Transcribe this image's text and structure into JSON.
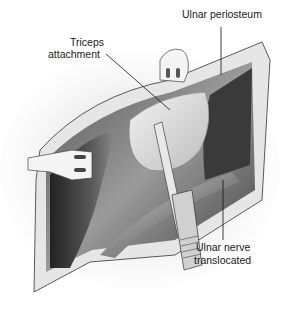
{
  "figure": {
    "type": "surgical-illustration",
    "labels": {
      "ulnar_periosteum": "Ulnar periosteum",
      "triceps_line1": "Triceps",
      "triceps_line2": "attachment",
      "nerve_line1": "Ulnar nerve",
      "nerve_line2": "translocated"
    }
  }
}
